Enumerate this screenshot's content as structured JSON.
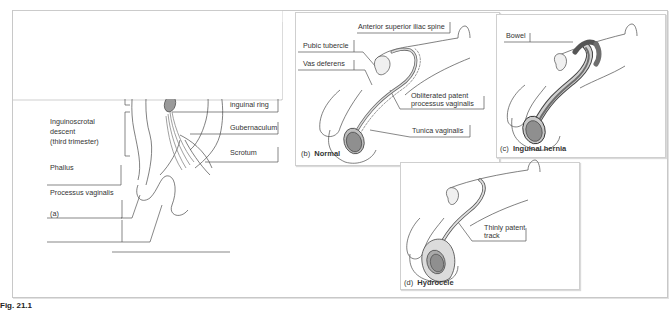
{
  "figure": {
    "panels": {
      "a": {
        "letter": "(a)",
        "labels_left": {
          "testis_line1": "Testis (retroperitoneal)",
          "testis_line2": "(on posterior abdominal wall)",
          "abdominal_descent": "Abdominal descent",
          "inguinoscrotal_line1": "Inguinoscrotal",
          "inguinoscrotal_line2": "descent",
          "inguinoscrotal_line3": "(third trimester)",
          "phallus": "Phallus",
          "processus_vaginalis": "Processus vaginalis"
        },
        "labels_right": {
          "peritoneum": "Peritoneum",
          "internal_ring_line1": "Internal",
          "internal_ring_line2": "inguinal ring",
          "gubernaculum": "Gubernaculum",
          "scrotum": "Scrotum"
        }
      },
      "b": {
        "letter": "(b)",
        "title": "Normal",
        "labels": {
          "asis": "Anterior superior iliac spine",
          "pubic_tubercle": "Pubic tubercle",
          "vas_deferens": "Vas deferens",
          "obliterated_line1": "Obliterated patent",
          "obliterated_line2": "processus vaginalis",
          "tunica_vaginalis": "Tunica vaginalis"
        }
      },
      "c": {
        "letter": "(c)",
        "title": "Inguinal hernia",
        "labels": {
          "bowel": "Bowel"
        }
      },
      "d": {
        "letter": "(d)",
        "title": "Hydrocele",
        "labels": {
          "thinly_line1": "Thinly patent",
          "thinly_line2": "track"
        }
      }
    },
    "colors": {
      "testis_fill": "#9a9a9a",
      "outline": "#4a4a4a",
      "hydrocele_fill": "#d8d8d8",
      "bowel_fill": "#6e6e6e",
      "panel_border": "#cfcfcf"
    },
    "caption_partial": "Fig. 21.1"
  }
}
